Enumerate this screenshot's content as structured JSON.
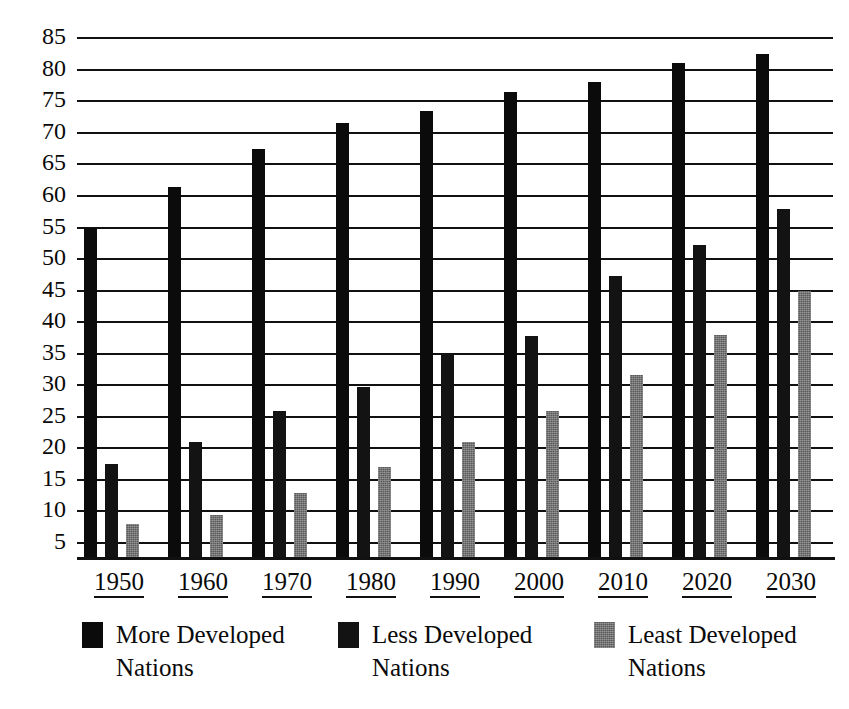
{
  "chart_data": {
    "type": "bar",
    "title": "",
    "xlabel": "",
    "ylabel": "",
    "categories": [
      "1950",
      "1960",
      "1970",
      "1980",
      "1990",
      "2000",
      "2010",
      "2020",
      "2030"
    ],
    "series": [
      {
        "name": "More Developed Nations",
        "color": "#0b0b0b",
        "values": [
          55.0,
          61.5,
          67.5,
          71.5,
          73.5,
          76.5,
          78.0,
          81.0,
          82.5
        ]
      },
      {
        "name": "Less Developed Nations",
        "color": "#131313",
        "values": [
          17.5,
          21.0,
          26.0,
          29.8,
          35.0,
          37.8,
          47.3,
          52.3,
          58.0
        ]
      },
      {
        "name": "Least Developed Nations",
        "color": "#5a5a5a",
        "values": [
          8.0,
          9.5,
          13.0,
          17.0,
          21.0,
          26.0,
          31.7,
          38.0,
          45.0
        ]
      }
    ],
    "ylim": [
      0,
      85
    ],
    "yticks": [
      85,
      80,
      75,
      70,
      65,
      60,
      55,
      50,
      45,
      40,
      35,
      30,
      25,
      20,
      15,
      10,
      5
    ],
    "ytick_labels": [
      "85",
      "80",
      "75",
      "70",
      "65",
      "60",
      "55",
      "50",
      "45",
      "40",
      "35",
      "30",
      "25",
      "20",
      "15",
      "10",
      "5"
    ],
    "grid": true,
    "grid_axis": "y",
    "legend_position": "bottom",
    "xtick_underlined": true
  },
  "legend": {
    "items": [
      {
        "label": "More Developed\nNations",
        "series": "More Developed Nations"
      },
      {
        "label": "Less Developed\nNations",
        "series": "Less Developed Nations"
      },
      {
        "label": "Least Developed\nNations",
        "series": "Least Developed Nations"
      }
    ]
  }
}
